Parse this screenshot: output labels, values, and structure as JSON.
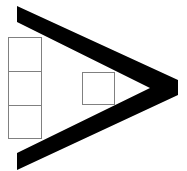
{
  "diagram": {
    "background": "#ffffff",
    "chevron": {
      "shape": "greater-than",
      "color": "#000000",
      "outer_points": "17,6 178,80 178,95 17,170",
      "inner_points": "17,22 150,88 17,153"
    },
    "stacked_boxes": {
      "stroke": "#808080",
      "fill": "#ffffff",
      "count": 3,
      "boxes": [
        {
          "x": 8,
          "y": 37,
          "w": 33,
          "h": 34
        },
        {
          "x": 8,
          "y": 71,
          "w": 33,
          "h": 34
        },
        {
          "x": 8,
          "y": 105,
          "w": 33,
          "h": 33
        }
      ]
    },
    "single_box": {
      "stroke": "#808080",
      "fill": "#ffffff",
      "x": 82,
      "y": 72,
      "w": 32,
      "h": 32
    }
  }
}
